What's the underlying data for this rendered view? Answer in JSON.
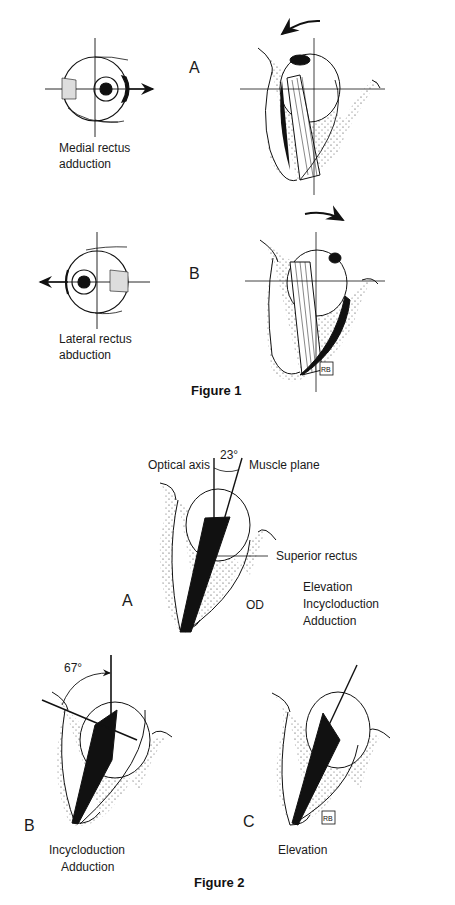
{
  "figure1": {
    "caption": "Figure 1",
    "panels": [
      {
        "letter": "A",
        "label_line1": "Medial rectus",
        "label_line2": "adduction"
      },
      {
        "letter": "B",
        "label_line1": "Lateral rectus",
        "label_line2": "abduction"
      }
    ]
  },
  "figure2": {
    "caption": "Figure 2",
    "panel_a": {
      "letter": "A",
      "angle": "23°",
      "optical_axis_label": "Optical axis",
      "muscle_plane_label": "Muscle plane",
      "muscle_label": "Superior rectus",
      "eye_label": "OD",
      "actions": [
        "Elevation",
        "Incycloduction",
        "Adduction"
      ]
    },
    "panel_b": {
      "letter": "B",
      "angle": "67°",
      "actions": [
        "Incycloduction",
        "Adduction"
      ]
    },
    "panel_c": {
      "letter": "C",
      "actions": [
        "Elevation"
      ]
    }
  }
}
